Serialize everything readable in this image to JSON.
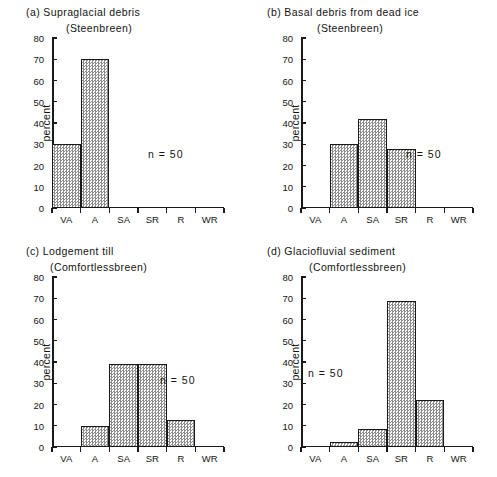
{
  "figure": {
    "width": 497,
    "height": 477,
    "background": "#ffffff",
    "ink": "#1a1a1a"
  },
  "shared": {
    "ylabel": "percent",
    "categories": [
      "VA",
      "A",
      "SA",
      "SR",
      "R",
      "WR"
    ],
    "yticks": [
      "0",
      "10",
      "20",
      "30",
      "40",
      "50",
      "60",
      "70",
      "80"
    ],
    "ylim": [
      0,
      80
    ],
    "annotation": "n = 50"
  },
  "panels": [
    {
      "key": "a",
      "tag": "(a)",
      "title": "(a)  Supraglacial debris",
      "subtitle": "(Steenbreen)",
      "n": "n = 50"
    },
    {
      "key": "b",
      "tag": "(b)",
      "title": "(b)  Basal debris from dead ice",
      "subtitle": "(Steenbreen)",
      "n": "n = 50"
    },
    {
      "key": "c",
      "tag": "(c)",
      "title": "(c)  Lodgement till",
      "subtitle": "(Comfortlessbreen)",
      "n": "n = 50"
    },
    {
      "key": "d",
      "tag": "(d)",
      "title": "(d)  Glaciofluvial sediment",
      "subtitle": "(Comfortlessbreen)",
      "n": "n = 50"
    }
  ],
  "chart_data": [
    {
      "type": "bar",
      "panel": "a",
      "title": "(a)  Supraglacial debris",
      "subtitle": "(Steenbreen)",
      "xlabel": "",
      "ylabel": "percent",
      "categories": [
        "VA",
        "A",
        "SA",
        "SR",
        "R",
        "WR"
      ],
      "values": [
        30,
        70,
        0,
        0,
        0,
        0
      ],
      "ylim": [
        0,
        80
      ],
      "ytick_step": 10,
      "grid": false,
      "legend": "none",
      "annotations": [
        "n = 50"
      ]
    },
    {
      "type": "bar",
      "panel": "b",
      "title": "(b)  Basal debris from dead ice",
      "subtitle": "(Steenbreen)",
      "xlabel": "",
      "ylabel": "percent",
      "categories": [
        "VA",
        "A",
        "SA",
        "SR",
        "R",
        "WR"
      ],
      "values": [
        0,
        30,
        42,
        28,
        0,
        0
      ],
      "ylim": [
        0,
        80
      ],
      "ytick_step": 10,
      "grid": false,
      "legend": "none",
      "annotations": [
        "n = 50"
      ]
    },
    {
      "type": "bar",
      "panel": "c",
      "title": "(c)  Lodgement till",
      "subtitle": "(Comfortlessbreen)",
      "xlabel": "",
      "ylabel": "percent",
      "categories": [
        "VA",
        "A",
        "SA",
        "SR",
        "R",
        "WR"
      ],
      "values": [
        0,
        10,
        39,
        39,
        12.5,
        0
      ],
      "ylim": [
        0,
        80
      ],
      "ytick_step": 10,
      "grid": false,
      "legend": "none",
      "annotations": [
        "n = 50"
      ]
    },
    {
      "type": "bar",
      "panel": "d",
      "title": "(d)  Glaciofluvial sediment",
      "subtitle": "(Comfortlessbreen)",
      "xlabel": "",
      "ylabel": "percent",
      "categories": [
        "VA",
        "A",
        "SA",
        "SR",
        "R",
        "WR"
      ],
      "values": [
        0,
        2.5,
        8.5,
        68.5,
        22,
        0
      ],
      "ylim": [
        0,
        80
      ],
      "ytick_step": 10,
      "grid": false,
      "legend": "none",
      "annotations": [
        "n = 50"
      ]
    }
  ],
  "n_positions": {
    "a": {
      "left": 148,
      "top": 148
    },
    "b": {
      "left": 406,
      "top": 148
    },
    "c": {
      "left": 160,
      "top": 374
    },
    "d": {
      "left": 308,
      "top": 367
    }
  }
}
